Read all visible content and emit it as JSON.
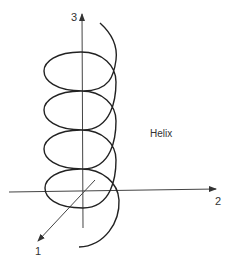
{
  "diagram": {
    "title": "Helix",
    "axes": [
      {
        "id": "axis-1",
        "label": "1"
      },
      {
        "id": "axis-2",
        "label": "2"
      },
      {
        "id": "axis-3",
        "label": "3"
      }
    ],
    "curve": {
      "name": "Helix",
      "turns": 4,
      "color": "#222222"
    }
  }
}
